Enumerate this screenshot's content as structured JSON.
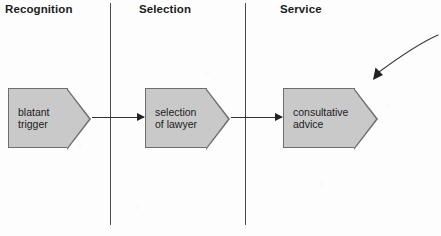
{
  "diagram": {
    "type": "process-flow",
    "stages": [
      {
        "id": "recognition",
        "header": "Recognition"
      },
      {
        "id": "selection",
        "header": "Selection"
      },
      {
        "id": "service",
        "header": "Service"
      }
    ],
    "nodes": [
      {
        "id": "node-1",
        "label": "blatant\ntrigger",
        "shape": "chevron",
        "stage": "recognition"
      },
      {
        "id": "node-2",
        "label": "selection\nof lawyer",
        "shape": "chevron",
        "stage": "selection"
      },
      {
        "id": "node-3",
        "label": "consultative\nadvice",
        "shape": "chevron",
        "stage": "service"
      }
    ],
    "connectors": [
      {
        "id": "connector-1",
        "from": "node-1",
        "to": "node-2",
        "style": "solid-arrow"
      },
      {
        "id": "connector-2",
        "from": "node-2",
        "to": "node-3",
        "style": "solid-arrow"
      }
    ],
    "annotations": [
      {
        "id": "annotation-arrow",
        "kind": "curved-arrow",
        "direction": "down-left"
      }
    ],
    "colors": {
      "node_fill": "#c9c9c9",
      "node_border": "#6e6e6e",
      "divider": "#4a4a4a",
      "text": "#1c1c1c",
      "connector": "#333333",
      "background": "#fdfdfd"
    }
  }
}
